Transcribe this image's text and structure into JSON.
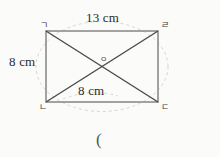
{
  "figure": {
    "kind": "rectangle-with-diagonals",
    "colors": {
      "background": "#fbfbf9",
      "stroke": "#8a8a8a",
      "diagonal_stroke": "#4a4a4a",
      "arc_stroke": "#cfcac2",
      "text": "#2b2b2b"
    },
    "rect": {
      "left": 46,
      "top": 31,
      "right": 158,
      "bottom": 102
    },
    "center": {
      "x": 102,
      "y": 66.5
    }
  },
  "labels": {
    "top_length": "13 cm",
    "left_length": "8 cm",
    "diagonal_length": "8 cm",
    "vertex_top_left": "ㄱ",
    "vertex_top_right": "ㄹ",
    "vertex_bottom_left": "ㄴ",
    "vertex_bottom_right": "ㄷ",
    "center_point": "ㅇ",
    "answer_paren": "("
  }
}
